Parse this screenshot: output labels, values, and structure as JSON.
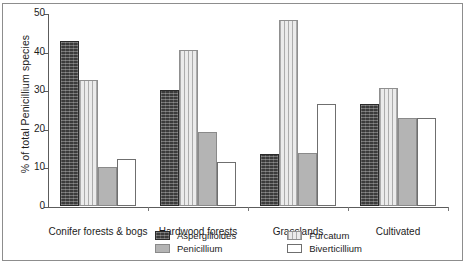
{
  "chart_data": {
    "type": "bar",
    "title": "",
    "subtitle": "",
    "xlabel": "",
    "ylabel": "% of total Penicillium species",
    "ylim": [
      0,
      50
    ],
    "yticks": [
      0,
      10,
      20,
      30,
      40,
      50
    ],
    "grid": false,
    "legend_position": "bottom",
    "categories": [
      "Conifer forests & bogs",
      "Hardwood forests",
      "Grasslands",
      "Cultivated"
    ],
    "series": [
      {
        "name": "Aspergilloides",
        "pattern": "dark-speckled",
        "color": "#3b3b3b",
        "values": [
          42.7,
          30.0,
          13.5,
          26.5
        ]
      },
      {
        "name": "Furcatum",
        "pattern": "light-vertical",
        "color": "#ebebeb",
        "values": [
          32.7,
          40.3,
          48.3,
          30.5
        ]
      },
      {
        "name": "Penicillium",
        "pattern": "solid-gray",
        "color": "#b4b4b4",
        "values": [
          10.2,
          19.3,
          13.7,
          22.7
        ]
      },
      {
        "name": "Biverticillium",
        "pattern": "white-outline",
        "color": "#ffffff",
        "values": [
          12.3,
          11.3,
          26.5,
          22.7
        ]
      }
    ]
  },
  "legend": {
    "items": [
      {
        "label": "Aspergilloides"
      },
      {
        "label": "Furcatum"
      },
      {
        "label": "Penicillium"
      },
      {
        "label": "Biverticillium"
      }
    ]
  }
}
